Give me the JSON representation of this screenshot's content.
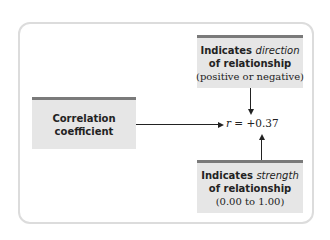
{
  "diagram": {
    "colors": {
      "box_fill": "#e6e6e6",
      "box_bar": "#7a7a7a",
      "frame_border": "#dcdcdc",
      "arrow": "#222222"
    },
    "coefficient_box": {
      "line1": "Correlation",
      "line2": "coefficient"
    },
    "direction_box": {
      "line1_prefix": "Indicates ",
      "line1_emph": "direction",
      "line2": "of relationship",
      "line3": "(positive or negative)"
    },
    "strength_box": {
      "line1_prefix": "Indicates ",
      "line1_emph": "strength",
      "line2": "of relationship",
      "line3": "(0.00 to 1.00)"
    },
    "result": {
      "symbol": "r",
      "equals": " = ",
      "value": "+0.37"
    }
  }
}
